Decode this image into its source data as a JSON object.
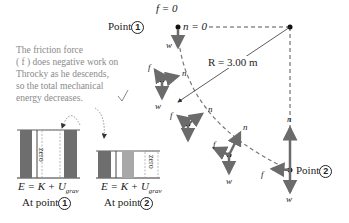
{
  "caption": {
    "line1": "The friction force",
    "line2": "( f ) does negative work on",
    "line3": "Throcky as he descends,",
    "line4": "so the total mechanical",
    "line5": "energy decreases."
  },
  "point1": {
    "label": "Point",
    "number": "1",
    "f_label": "f = 0",
    "n_label": "n = 0"
  },
  "point2": {
    "label": "Point",
    "number": "2"
  },
  "radius_label": "R = 3.00 m",
  "vector_labels": {
    "w": "w",
    "n": "n",
    "f": "f"
  },
  "bar_chart_1": {
    "equation": "E = K + U",
    "subscript": "grav",
    "zero_label": "zero",
    "caption": "At point",
    "number": "1"
  },
  "bar_chart_2": {
    "equation": "E = K + U",
    "subscript": "grav",
    "zero_label": "zero",
    "caption": "At point",
    "number": "2"
  },
  "colors": {
    "vector": "#6b6b6b",
    "bar_dark": "#6e6e6e",
    "bar_light": "#a8a8a8",
    "dash": "#555555"
  }
}
